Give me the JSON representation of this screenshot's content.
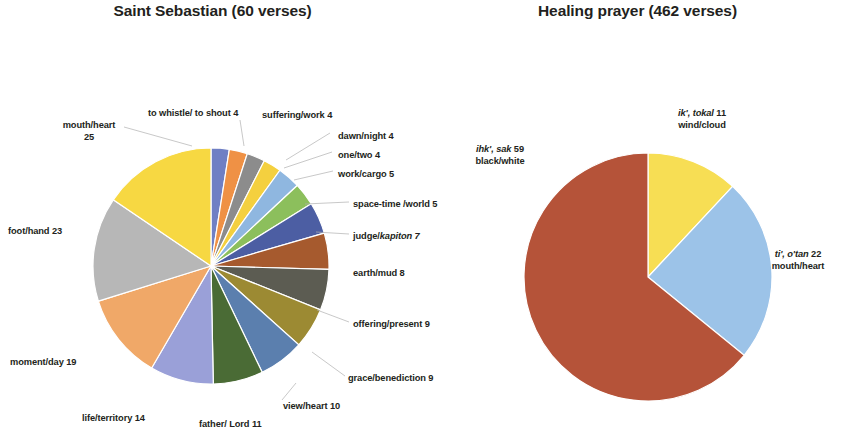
{
  "charts": [
    {
      "title": "Saint Sebastian (60 verses)",
      "center": [
        211,
        266
      ],
      "radius": 118,
      "labels": [
        {
          "lines": [
            "to whistle/ to shout  4"
          ],
          "x": 148,
          "y": 108,
          "align": "l"
        },
        {
          "lines": [
            "suffering/work 4"
          ],
          "x": 262,
          "y": 110,
          "align": "l"
        },
        {
          "lines": [
            "dawn/night 4"
          ],
          "x": 338,
          "y": 131,
          "align": "l"
        },
        {
          "lines": [
            "one/two 4"
          ],
          "x": 338,
          "y": 150,
          "align": "l"
        },
        {
          "lines": [
            "work/cargo 5"
          ],
          "x": 338,
          "y": 169,
          "align": "l"
        },
        {
          "lines": [
            "space-time /world 5"
          ],
          "x": 353,
          "y": 199,
          "align": "l"
        },
        {
          "lines": [
            "judge/kapiton 7"
          ],
          "x": 353,
          "y": 231,
          "align": "l",
          "italic_from": 6
        },
        {
          "lines": [
            "earth/mud  8"
          ],
          "x": 353,
          "y": 268,
          "align": "l"
        },
        {
          "lines": [
            "offering/present  9"
          ],
          "x": 353,
          "y": 319,
          "align": "l"
        },
        {
          "lines": [
            "grace/benediction 9"
          ],
          "x": 348,
          "y": 373,
          "align": "l"
        },
        {
          "lines": [
            "view/heart 10"
          ],
          "x": 283,
          "y": 401,
          "align": "l"
        },
        {
          "lines": [
            "father/ Lord 11"
          ],
          "x": 199,
          "y": 419,
          "align": "l"
        },
        {
          "lines": [
            "life/territory 14"
          ],
          "x": 82,
          "y": 413,
          "align": "l"
        },
        {
          "lines": [
            "moment/day 19"
          ],
          "x": 10,
          "y": 357,
          "align": "l"
        },
        {
          "lines": [
            "foot/hand 23"
          ],
          "x": 8,
          "y": 226,
          "align": "l"
        },
        {
          "lines": [
            "mouth/heart",
            "25"
          ],
          "x": 49,
          "y": 120,
          "align": "c",
          "w": 80
        }
      ]
    },
    {
      "title": "Healing prayer (462 verses)",
      "center": [
        648,
        277
      ],
      "radius": 124,
      "labels": [
        {
          "lines": [
            "ik', tokal 11",
            "wind/cloud"
          ],
          "x": 663,
          "y": 108,
          "align": "c",
          "w": 78
        },
        {
          "lines": [
            "ihk', sak 59",
            "black/white"
          ],
          "x": 460,
          "y": 144,
          "align": "c",
          "w": 80
        },
        {
          "lines": [
            "ti', o'tan  22",
            "mouth/heart"
          ],
          "x": 758,
          "y": 249,
          "align": "c",
          "w": 80
        }
      ]
    }
  ],
  "chart_data": [
    {
      "type": "pie",
      "title": "Saint Sebastian (60 verses)",
      "total_verses": 60,
      "units": "occurrences",
      "start_angle_deg": 0,
      "direction": "clockwise",
      "categories": [
        "to whistle/ to shout",
        "suffering/work",
        "dawn/night",
        "one/two",
        "work/cargo",
        "space-time /world",
        "judge/kapiton",
        "earth/mud",
        "offering/present",
        "grace/benediction",
        "view/heart",
        "father/ Lord",
        "life/territory",
        "moment/day",
        "foot/hand",
        "mouth/heart"
      ],
      "values": [
        4,
        4,
        4,
        4,
        5,
        5,
        7,
        8,
        9,
        9,
        10,
        11,
        14,
        19,
        23,
        25
      ],
      "colors": [
        "#6f7fc4",
        "#ef9145",
        "#8c8c8c",
        "#f4d03f",
        "#8fb7e0",
        "#8cbf5c",
        "#4c5ea3",
        "#a65a2e",
        "#5c5c52",
        "#9c8a33",
        "#5b7fae",
        "#4a6b35",
        "#9aa0d8",
        "#f0a868",
        "#b7b7b7",
        "#f7d842"
      ],
      "legend": "none",
      "grid": false,
      "labels_shown": "category + value, outside with leader lines"
    },
    {
      "type": "pie",
      "title": "Healing prayer (462 verses)",
      "total_verses": 462,
      "units": "occurrences",
      "start_angle_deg": 0,
      "direction": "clockwise",
      "categories": [
        "ik', tokal — wind/cloud",
        "ti', o'tan — mouth/heart",
        "ihk', sak — black/white"
      ],
      "values": [
        11,
        22,
        59
      ],
      "colors": [
        "#f7de54",
        "#9cc3e8",
        "#b55339"
      ],
      "legend": "none",
      "grid": false,
      "labels_shown": "category + value, outside"
    }
  ]
}
